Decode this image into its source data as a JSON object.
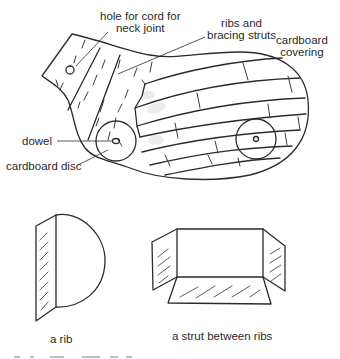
{
  "figure": {
    "main_diagram": {
      "title": "cardboard body construction",
      "labels": {
        "hole_for_cord": [
          "hole for cord for",
          "neck joint"
        ],
        "ribs_and_struts": [
          "ribs and",
          "bracing struts"
        ],
        "cardboard_covering": [
          "cardboard",
          "covering"
        ],
        "dowel": "dowel",
        "cardboard_disc": "cardboard disc"
      }
    },
    "details": {
      "rib": {
        "caption": "a rib"
      },
      "strut": {
        "caption": "a strut between ribs"
      }
    }
  },
  "colors": {
    "ink": "#2b2b2b",
    "background": "#ffffff"
  }
}
